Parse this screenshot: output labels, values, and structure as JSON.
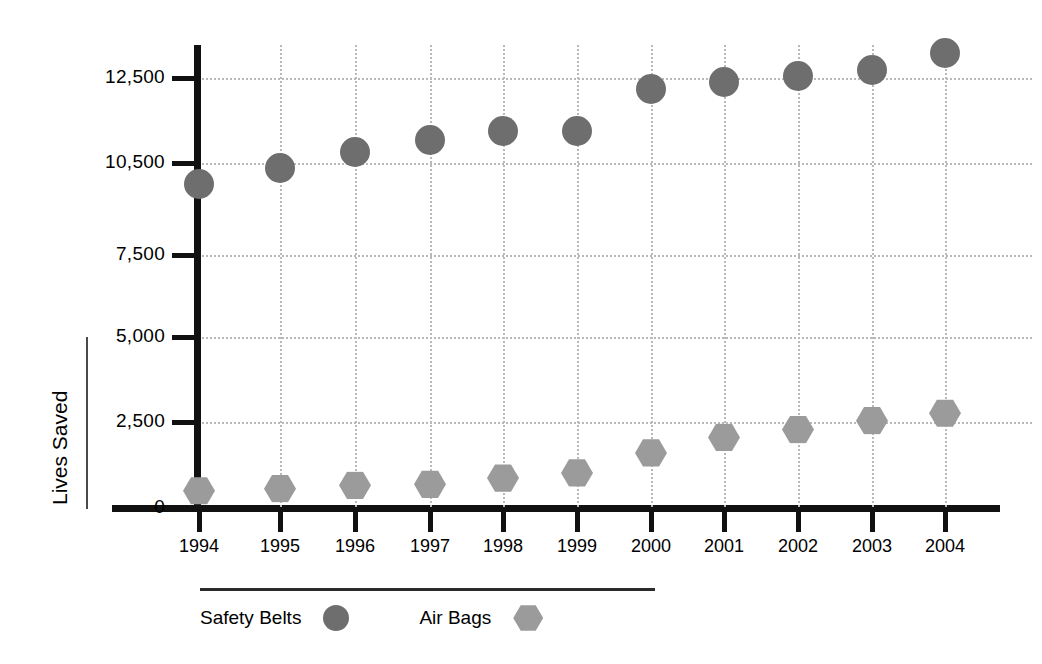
{
  "chart_data": {
    "type": "scatter",
    "title": "",
    "subtitle": "",
    "xlabel": "",
    "ylabel": "Lives Saved",
    "categories": [
      "1994",
      "1995",
      "1996",
      "1997",
      "1998",
      "1999",
      "2000",
      "2001",
      "2002",
      "2003",
      "2004"
    ],
    "ytick_labels": [
      "12,500",
      "10,500",
      "7,500",
      "5,000",
      "2,500",
      "0"
    ],
    "ytick_values": [
      12500,
      10500,
      7500,
      5000,
      2500,
      0
    ],
    "yaxis_note": "non-linear / irregularly spaced tick scale as drawn",
    "grid": "dotted gridlines at each y tick and each year after 1994",
    "legend_position": "bottom-left",
    "series": [
      {
        "name": "Safety Belts",
        "marker": "circle",
        "color": "#6e6e6e",
        "values": [
          9800,
          10350,
          10750,
          11050,
          11250,
          11250,
          12250,
          12400,
          12550,
          12700,
          13100
        ]
      },
      {
        "name": "Air Bags",
        "marker": "hexagon",
        "color": "#9b9b9b",
        "values": [
          500,
          560,
          660,
          690,
          870,
          1020,
          1600,
          2050,
          2280,
          2540,
          2760
        ]
      }
    ]
  },
  "axis": {
    "y_title": "Lives Saved"
  },
  "legend": {
    "items": [
      {
        "label": "Safety Belts",
        "marker": "circle",
        "color": "#6e6e6e"
      },
      {
        "label": "Air Bags",
        "marker": "hexagon",
        "color": "#9b9b9b"
      }
    ]
  },
  "colors": {
    "safety_belts": "#6e6e6e",
    "air_bags": "#9b9b9b",
    "axis": "#111111",
    "grid": "#b9b9b9",
    "background": "#ffffff"
  }
}
